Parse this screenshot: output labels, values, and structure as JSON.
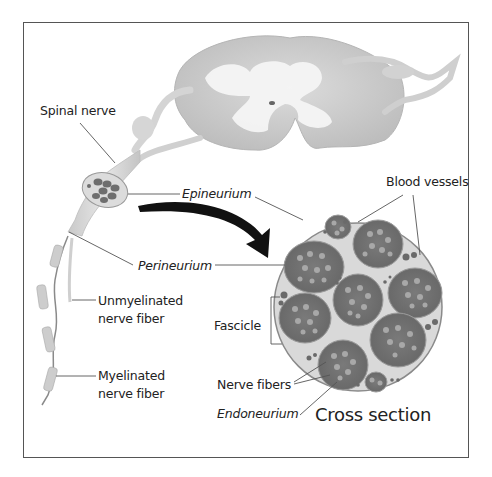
{
  "diagram": {
    "title": "Cross section",
    "labels": {
      "spinal_nerve": "Spinal nerve",
      "epineurium": "Epineurium",
      "perineurium": "Perineurium",
      "unmyelinated_1": "Unmyelinated",
      "unmyelinated_2": "nerve fiber",
      "myelinated_1": "Myelinated",
      "myelinated_2": "nerve fiber",
      "blood_vessels": "Blood vessels",
      "fascicle": "Fascicle",
      "nerve_fibers": "Nerve fibers",
      "endoneurium": "Endoneurium"
    },
    "colors": {
      "outline": "#555555",
      "cord_gray": "#cfcfcf",
      "cord_white": "#f2f2f2",
      "fascicle": "#6e6e6e",
      "fiber": "#a9a9a9",
      "arrow": "#111111",
      "cross_fill": "#d6d6d6"
    }
  }
}
